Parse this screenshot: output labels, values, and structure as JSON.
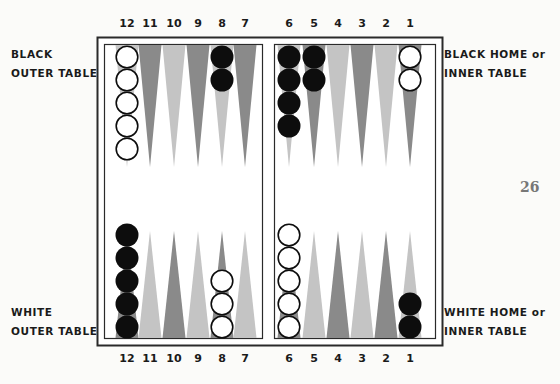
{
  "labels": {
    "black_outer": [
      "BLACK",
      "OUTER TABLE"
    ],
    "black_home": [
      "BLACK HOME or",
      "INNER TABLE"
    ],
    "white_outer": [
      "WHITE",
      "OUTER TABLE"
    ],
    "white_home": [
      "WHITE HOME or",
      "INNER TABLE"
    ]
  },
  "page_number": "26",
  "point_numbers": {
    "left": [
      "12",
      "11",
      "10",
      "9",
      "8",
      "7"
    ],
    "right": [
      "6",
      "5",
      "4",
      "3",
      "2",
      "1"
    ]
  },
  "colors": {
    "dark_point": "#8a8a8a",
    "light_point": "#c4c4c4",
    "board_bg": "#ffffff",
    "frame": "#2a2a2a",
    "black_checker": "#0d0d0d",
    "white_checker": "#ffffff"
  },
  "position": {
    "top": [
      {
        "point": "12",
        "color": "white",
        "count": 5
      },
      {
        "point": "8",
        "color": "black",
        "count": 2
      },
      {
        "point": "6",
        "color": "black",
        "count": 4
      },
      {
        "point": "5",
        "color": "black",
        "count": 2
      },
      {
        "point": "1",
        "color": "white",
        "count": 2
      }
    ],
    "bottom": [
      {
        "point": "12",
        "color": "black",
        "count": 5
      },
      {
        "point": "8",
        "color": "white",
        "count": 3
      },
      {
        "point": "6",
        "color": "white",
        "count": 5
      },
      {
        "point": "1",
        "color": "black",
        "count": 2
      }
    ]
  }
}
